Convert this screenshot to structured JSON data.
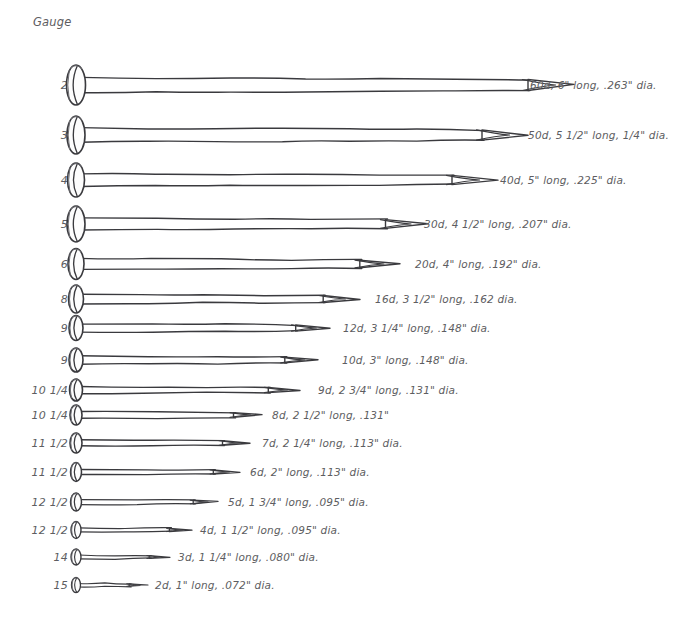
{
  "header": {
    "gauge_column_title": "Gauge"
  },
  "chart_data": {
    "type": "table",
    "columns": [
      "Gauge",
      "Penny Size",
      "Length",
      "Diameter"
    ],
    "rows": [
      {
        "gauge": "2",
        "penny": "60d",
        "length": "6\"",
        "diameter": ".263\"",
        "label": "60d, 6\" long, .263\" dia.",
        "length_in": 6.0,
        "dia_in": 0.263
      },
      {
        "gauge": "3",
        "penny": "50d",
        "length": "5 1/2\"",
        "diameter": "1/4\"",
        "label": "50d, 5 1/2\" long, 1/4\" dia.",
        "length_in": 5.5,
        "dia_in": 0.25
      },
      {
        "gauge": "4",
        "penny": "40d",
        "length": "5\"",
        "diameter": ".225\"",
        "label": "40d, 5\" long, .225\" dia.",
        "length_in": 5.0,
        "dia_in": 0.225
      },
      {
        "gauge": "5",
        "penny": "30d",
        "length": "4 1/2\"",
        "diameter": ".207\"",
        "label": "30d, 4 1/2\" long, .207\" dia.",
        "length_in": 4.5,
        "dia_in": 0.207
      },
      {
        "gauge": "6",
        "penny": "20d",
        "length": "4\"",
        "diameter": ".192\"",
        "label": "20d, 4\" long, .192\" dia.",
        "length_in": 4.0,
        "dia_in": 0.192
      },
      {
        "gauge": "8",
        "penny": "16d",
        "length": "3 1/2\"",
        "diameter": ".162",
        "label": "16d, 3 1/2\" long, .162 dia.",
        "length_in": 3.5,
        "dia_in": 0.162
      },
      {
        "gauge": "9",
        "penny": "12d",
        "length": "3 1/4\"",
        "diameter": ".148\"",
        "label": "12d, 3 1/4\" long, .148\" dia.",
        "length_in": 3.25,
        "dia_in": 0.148
      },
      {
        "gauge": "9",
        "penny": "10d",
        "length": "3\"",
        "diameter": ".148\"",
        "label": "10d, 3\" long, .148\" dia.",
        "length_in": 3.0,
        "dia_in": 0.148
      },
      {
        "gauge": "10 1/4",
        "penny": "9d",
        "length": "2 3/4\"",
        "diameter": ".131\"",
        "label": "9d, 2 3/4\" long, .131\" dia.",
        "length_in": 2.75,
        "dia_in": 0.131
      },
      {
        "gauge": "10 1/4",
        "penny": "8d",
        "length": "2 1/2\"",
        "diameter": ".131\"",
        "label": "8d, 2 1/2\" long, .131\"",
        "length_in": 2.5,
        "dia_in": 0.131
      },
      {
        "gauge": "11 1/2",
        "penny": "7d",
        "length": "2 1/4\"",
        "diameter": ".113\"",
        "label": "7d, 2 1/4\" long, .113\" dia.",
        "length_in": 2.25,
        "dia_in": 0.113
      },
      {
        "gauge": "11 1/2",
        "penny": "6d",
        "length": "2\"",
        "diameter": ".113\"",
        "label": "6d, 2\" long, .113\" dia.",
        "length_in": 2.0,
        "dia_in": 0.113
      },
      {
        "gauge": "12 1/2",
        "penny": "5d",
        "length": "1 3/4\"",
        "diameter": ".095\"",
        "label": "5d, 1 3/4\" long, .095\" dia.",
        "length_in": 1.75,
        "dia_in": 0.095
      },
      {
        "gauge": "12 1/2",
        "penny": "4d",
        "length": "1 1/2\"",
        "diameter": ".095\"",
        "label": "4d, 1 1/2\" long, .095\" dia.",
        "length_in": 1.5,
        "dia_in": 0.095
      },
      {
        "gauge": "14",
        "penny": "3d",
        "length": "1 1/4\"",
        "diameter": ".080\"",
        "label": "3d, 1 1/4\" long, .080\" dia.",
        "length_in": 1.25,
        "dia_in": 0.08
      },
      {
        "gauge": "15",
        "penny": "2d",
        "length": "1\"",
        "diameter": ".072\"",
        "label": "2d, 1\" long, .072\" dia.",
        "length_in": 1.0,
        "dia_in": 0.072
      }
    ],
    "ink_color": "#3a3a3e",
    "text_color": "#5d5d61",
    "background": "#ffffff"
  },
  "layout": {
    "rows": [
      {
        "y": 85,
        "gauge_right": 68,
        "head_cx": 76,
        "head_rx": 9.5,
        "head_ry": 20.0,
        "shaft_h": 15.0,
        "tip_x": 574,
        "label_x": 530
      },
      {
        "y": 135,
        "gauge_right": 68,
        "head_cx": 76,
        "head_rx": 9.0,
        "head_ry": 19.0,
        "shaft_h": 14.0,
        "tip_x": 528,
        "label_x": 528
      },
      {
        "y": 180,
        "gauge_right": 68,
        "head_cx": 76,
        "head_rx": 8.5,
        "head_ry": 17.0,
        "shaft_h": 12.5,
        "tip_x": 498,
        "label_x": 500
      },
      {
        "y": 224,
        "gauge_right": 68,
        "head_cx": 76,
        "head_rx": 9.0,
        "head_ry": 18.0,
        "shaft_h": 12.0,
        "tip_x": 428,
        "label_x": 424
      },
      {
        "y": 264,
        "gauge_right": 68,
        "head_cx": 76,
        "head_rx": 8.0,
        "head_ry": 15.5,
        "shaft_h": 10.5,
        "tip_x": 400,
        "label_x": 415
      },
      {
        "y": 299,
        "gauge_right": 68,
        "head_cx": 76,
        "head_rx": 7.5,
        "head_ry": 14.0,
        "shaft_h": 9.5,
        "tip_x": 360,
        "label_x": 375
      },
      {
        "y": 328,
        "gauge_right": 68,
        "head_cx": 76,
        "head_rx": 7.0,
        "head_ry": 12.5,
        "shaft_h": 8.5,
        "tip_x": 330,
        "label_x": 343
      },
      {
        "y": 360,
        "gauge_right": 68,
        "head_cx": 76,
        "head_rx": 7.0,
        "head_ry": 12.0,
        "shaft_h": 8.0,
        "tip_x": 318,
        "label_x": 342
      },
      {
        "y": 390,
        "gauge_right": 68,
        "head_cx": 76,
        "head_rx": 6.5,
        "head_ry": 11.0,
        "shaft_h": 7.0,
        "tip_x": 300,
        "label_x": 318
      },
      {
        "y": 415,
        "gauge_right": 68,
        "head_cx": 76,
        "head_rx": 6.0,
        "head_ry": 10.0,
        "shaft_h": 6.5,
        "tip_x": 262,
        "label_x": 272
      },
      {
        "y": 443,
        "gauge_right": 68,
        "head_cx": 76,
        "head_rx": 6.0,
        "head_ry": 10.0,
        "shaft_h": 6.0,
        "tip_x": 250,
        "label_x": 262
      },
      {
        "y": 472,
        "gauge_right": 68,
        "head_cx": 76,
        "head_rx": 5.5,
        "head_ry": 9.5,
        "shaft_h": 5.5,
        "tip_x": 240,
        "label_x": 250
      },
      {
        "y": 502,
        "gauge_right": 68,
        "head_cx": 76,
        "head_rx": 5.5,
        "head_ry": 9.0,
        "shaft_h": 5.0,
        "tip_x": 218,
        "label_x": 228
      },
      {
        "y": 530,
        "gauge_right": 68,
        "head_cx": 76,
        "head_rx": 5.0,
        "head_ry": 8.5,
        "shaft_h": 4.5,
        "tip_x": 192,
        "label_x": 200
      },
      {
        "y": 557,
        "gauge_right": 68,
        "head_cx": 76,
        "head_rx": 5.0,
        "head_ry": 8.0,
        "shaft_h": 4.0,
        "tip_x": 170,
        "label_x": 178
      },
      {
        "y": 585,
        "gauge_right": 68,
        "head_cx": 76,
        "head_rx": 4.5,
        "head_ry": 7.5,
        "shaft_h": 3.5,
        "tip_x": 148,
        "label_x": 155
      }
    ]
  }
}
